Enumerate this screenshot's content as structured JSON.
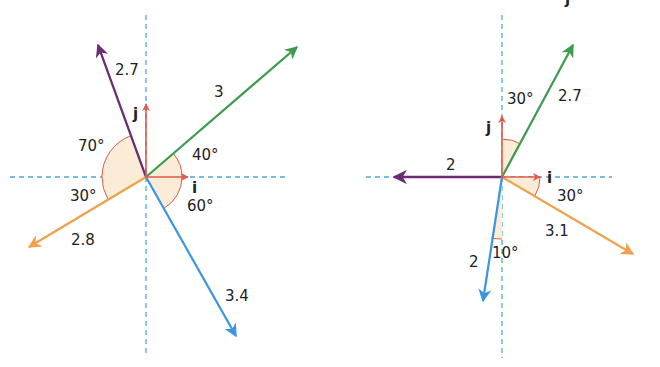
{
  "diagrams": [
    {
      "id": "left",
      "origin": [
        146,
        177
      ],
      "axes": {
        "color": "#4fa8dc",
        "h": [
          10,
          287
        ],
        "v": [
          15,
          355
        ]
      },
      "unit_vectors": {
        "i": {
          "label": "i",
          "tip": [
            188,
            177
          ],
          "label_pos": [
            192,
            193
          ]
        },
        "j": {
          "label": "j",
          "tip": [
            146,
            104
          ],
          "label_pos": [
            133,
            119
          ]
        },
        "color": "#e05a47"
      },
      "vectors": [
        {
          "name": "green",
          "magnitude": "3",
          "angle_label": "40°",
          "color": "#3d9a4e",
          "tip": [
            297,
            47
          ],
          "label_pos": [
            214,
            97
          ],
          "angle_pos": [
            192,
            160
          ]
        },
        {
          "name": "purple",
          "magnitude": "2.7",
          "angle_label": "70°",
          "color": "#6b2c74",
          "tip": [
            98,
            45
          ],
          "label_pos": [
            115,
            75
          ],
          "angle_pos": [
            78,
            151
          ]
        },
        {
          "name": "orange",
          "magnitude": "2.8",
          "angle_label": "30°",
          "color": "#f0a04b",
          "tip": [
            29,
            247
          ],
          "label_pos": [
            71,
            245
          ],
          "angle_pos": [
            70,
            201
          ]
        },
        {
          "name": "blue",
          "magnitude": "3.4",
          "angle_label": "60°",
          "color": "#3b95e0",
          "tip": [
            236,
            336
          ],
          "label_pos": [
            225,
            301
          ],
          "angle_pos": [
            187,
            211
          ]
        }
      ],
      "arcs": [
        {
          "from_deg": 0,
          "to_deg": 40,
          "r": 36
        },
        {
          "from_deg": 110,
          "to_deg": 180,
          "r": 44
        },
        {
          "from_deg": 180,
          "to_deg": 210,
          "r": 44
        },
        {
          "from_deg": -60,
          "to_deg": 0,
          "r": 36
        }
      ]
    },
    {
      "id": "right",
      "origin": [
        502,
        177
      ],
      "axes": {
        "color": "#4fa8dc",
        "h": [
          366,
          612
        ],
        "v": [
          15,
          358
        ]
      },
      "unit_vectors": {
        "i": {
          "label": "i",
          "tip": [
            540,
            177
          ],
          "label_pos": [
            547,
            183
          ]
        },
        "j": {
          "label": "j",
          "tip": [
            502,
            116
          ],
          "label_pos": [
            486,
            133
          ]
        },
        "color": "#e05a47"
      },
      "vectors": [
        {
          "name": "green",
          "magnitude": "2.7",
          "angle_label": "30°",
          "color": "#3d9a4e",
          "tip": [
            573,
            45
          ],
          "label_pos": [
            558,
            101
          ],
          "angle_pos": [
            507,
            104
          ]
        },
        {
          "name": "purple",
          "magnitude": "2",
          "angle_label": "",
          "color": "#6b2c74",
          "tip": [
            394,
            177
          ],
          "label_pos": [
            446,
            170
          ],
          "angle_pos": [
            0,
            0
          ]
        },
        {
          "name": "orange",
          "magnitude": "3.1",
          "angle_label": "30°",
          "color": "#f0a04b",
          "tip": [
            633,
            254
          ],
          "label_pos": [
            545,
            236
          ],
          "angle_pos": [
            557,
            201
          ]
        },
        {
          "name": "blue",
          "magnitude": "2",
          "angle_label": "10°",
          "color": "#3b95e0",
          "tip": [
            483,
            301
          ],
          "label_pos": [
            469,
            267
          ],
          "angle_pos": [
            492,
            258
          ]
        }
      ],
      "arcs": [
        {
          "from_deg": 60,
          "to_deg": 90,
          "r": 38
        },
        {
          "from_deg": -30,
          "to_deg": 0,
          "r": 38
        },
        {
          "from_deg": 260,
          "to_deg": 270,
          "r": 62
        }
      ]
    }
  ],
  "header_fragment": "j"
}
